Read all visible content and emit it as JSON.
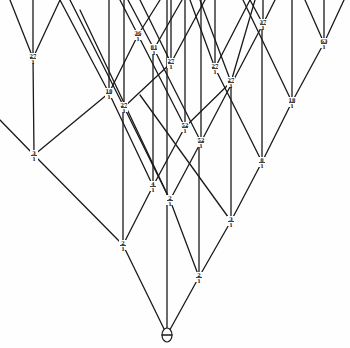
{
  "diagram": {
    "type": "tree",
    "colors": {
      "ink": "#1a1a1a",
      "paper": "#fefefe"
    },
    "root": {
      "id": "root",
      "x": 167,
      "y": 335,
      "label": "⊕"
    },
    "nodes": [
      {
        "id": "n1",
        "x": 123,
        "y": 245,
        "label": "2/1"
      },
      {
        "id": "n2",
        "x": 199,
        "y": 277,
        "label": "2/1"
      },
      {
        "id": "n3",
        "x": 34,
        "y": 155,
        "label": "3/1"
      },
      {
        "id": "n4",
        "x": 153,
        "y": 186,
        "label": "4/1"
      },
      {
        "id": "n5",
        "x": 170,
        "y": 200,
        "label": "2/1"
      },
      {
        "id": "n6",
        "x": 231,
        "y": 221,
        "label": "3/1"
      },
      {
        "id": "n7",
        "x": 262,
        "y": 162,
        "label": "8/1"
      },
      {
        "id": "n8",
        "x": 185,
        "y": 127,
        "label": "52/1"
      },
      {
        "id": "n9",
        "x": 201,
        "y": 142,
        "label": "52/1"
      },
      {
        "id": "n10",
        "x": 109,
        "y": 93,
        "label": "18/1"
      },
      {
        "id": "n11",
        "x": 124,
        "y": 107,
        "label": "27/1"
      },
      {
        "id": "n12",
        "x": 33,
        "y": 58,
        "label": "27/1"
      },
      {
        "id": "n13",
        "x": 138,
        "y": 35,
        "label": "36/1"
      },
      {
        "id": "n14",
        "x": 154,
        "y": 49,
        "label": "81/1"
      },
      {
        "id": "n15",
        "x": 171,
        "y": 63,
        "label": "27/1"
      },
      {
        "id": "n16",
        "x": 215,
        "y": 68,
        "label": "27/1"
      },
      {
        "id": "n17",
        "x": 231,
        "y": 82,
        "label": "27/1"
      },
      {
        "id": "n18",
        "x": 263,
        "y": 24,
        "label": "37/1"
      },
      {
        "id": "n19",
        "x": 324,
        "y": 43,
        "label": "63/1"
      },
      {
        "id": "n20",
        "x": 292,
        "y": 102,
        "label": "18/1"
      }
    ],
    "edges": [
      [
        167,
        335,
        123,
        245
      ],
      [
        167,
        335,
        199,
        277
      ],
      [
        167,
        335,
        167,
        0
      ],
      [
        123,
        245,
        34,
        155
      ],
      [
        123,
        245,
        153,
        186
      ],
      [
        123,
        245,
        123,
        107
      ],
      [
        199,
        277,
        170,
        200
      ],
      [
        199,
        277,
        231,
        221
      ],
      [
        199,
        277,
        199,
        142
      ],
      [
        34,
        155,
        33,
        58
      ],
      [
        34,
        155,
        109,
        93
      ],
      [
        34,
        155,
        0,
        120
      ],
      [
        153,
        186,
        109,
        93
      ],
      [
        153,
        186,
        185,
        127
      ],
      [
        153,
        186,
        153,
        49
      ],
      [
        170,
        200,
        124,
        107
      ],
      [
        170,
        200,
        201,
        142
      ],
      [
        170,
        200,
        80,
        10
      ],
      [
        231,
        221,
        262,
        162
      ],
      [
        231,
        221,
        231,
        82
      ],
      [
        231,
        221,
        140,
        95
      ],
      [
        262,
        162,
        215,
        68
      ],
      [
        262,
        162,
        292,
        102
      ],
      [
        262,
        162,
        262,
        24
      ],
      [
        185,
        127,
        138,
        35
      ],
      [
        185,
        127,
        231,
        82
      ],
      [
        185,
        127,
        185,
        0
      ],
      [
        201,
        142,
        154,
        49
      ],
      [
        201,
        142,
        263,
        24
      ],
      [
        201,
        142,
        201,
        0
      ],
      [
        109,
        93,
        60,
        0
      ],
      [
        109,
        93,
        138,
        35
      ],
      [
        109,
        93,
        109,
        0
      ],
      [
        124,
        107,
        70,
        0
      ],
      [
        124,
        107,
        171,
        63
      ],
      [
        124,
        107,
        124,
        0
      ],
      [
        33,
        58,
        10,
        0
      ],
      [
        33,
        58,
        60,
        0
      ],
      [
        33,
        58,
        33,
        0
      ],
      [
        138,
        35,
        120,
        0
      ],
      [
        138,
        35,
        160,
        0
      ],
      [
        154,
        49,
        128,
        0
      ],
      [
        154,
        49,
        182,
        0
      ],
      [
        171,
        63,
        140,
        0
      ],
      [
        171,
        63,
        205,
        0
      ],
      [
        171,
        63,
        171,
        0
      ],
      [
        215,
        68,
        190,
        0
      ],
      [
        215,
        68,
        250,
        0
      ],
      [
        215,
        68,
        215,
        0
      ],
      [
        231,
        82,
        255,
        0
      ],
      [
        231,
        82,
        200,
        0
      ],
      [
        263,
        24,
        250,
        0
      ],
      [
        263,
        24,
        275,
        0
      ],
      [
        263,
        24,
        263,
        0
      ],
      [
        324,
        43,
        305,
        0
      ],
      [
        324,
        43,
        344,
        0
      ],
      [
        324,
        43,
        324,
        0
      ],
      [
        292,
        102,
        292,
        0
      ],
      [
        292,
        102,
        324,
        43
      ],
      [
        292,
        102,
        243,
        0
      ]
    ]
  }
}
